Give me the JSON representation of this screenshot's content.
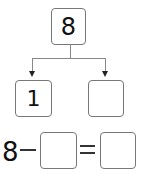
{
  "tree": {
    "top": {
      "value": "8"
    },
    "left": {
      "value": "1"
    },
    "right": {
      "value": ""
    }
  },
  "equation": {
    "minuend": "8",
    "operator": "minus",
    "subtrahend": "",
    "equals": "=",
    "result": ""
  }
}
